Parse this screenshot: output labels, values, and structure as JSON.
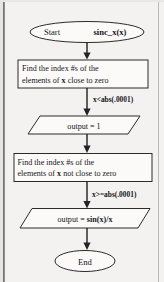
{
  "diagram": {
    "type": "flowchart",
    "background_color": "#f3f2f0",
    "line_color": "#25232a",
    "shape_fill": "#fbfaf9"
  },
  "nodes": {
    "start": {
      "shape": "terminator-oval",
      "text_plain": "Start",
      "text_bold": "sinc_x(x)"
    },
    "process_near_zero": {
      "shape": "process-rectangle",
      "line1_a": "Find the index #s of the",
      "line2_a": "elements of ",
      "line2_bold": "x",
      "line2_b": " close to zero"
    },
    "output_one": {
      "shape": "io-parallelogram",
      "text": "output = 1"
    },
    "process_not_near_zero": {
      "shape": "process-rectangle",
      "line1_a": "Find the index #s of the",
      "line2_a": "elements of ",
      "line2_bold": "x",
      "line2_b": " not close to zero"
    },
    "output_sinc": {
      "shape": "io-parallelogram",
      "text_plain": "output = ",
      "text_bold": "sin(x)/x"
    },
    "end": {
      "shape": "terminator-oval",
      "text": "End"
    }
  },
  "edge_labels": {
    "branch_near_zero": "x<abs(.0001)",
    "branch_not_near_zero": "x>=abs(.0001)"
  }
}
